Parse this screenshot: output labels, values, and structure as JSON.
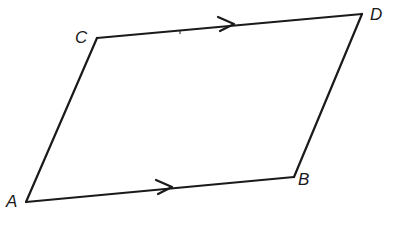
{
  "diagram": {
    "type": "parallelogram",
    "stroke_color": "#1a1a1a",
    "background": "#ffffff",
    "vertices": {
      "A": {
        "label": "A",
        "x": 26,
        "y": 202
      },
      "B": {
        "label": "B",
        "x": 294,
        "y": 177
      },
      "C": {
        "label": "C",
        "x": 97,
        "y": 38
      },
      "D": {
        "label": "D",
        "x": 362,
        "y": 14
      }
    },
    "edges": [
      {
        "from": "A",
        "to": "B",
        "arrow": true
      },
      {
        "from": "C",
        "to": "D",
        "arrow": true
      },
      {
        "from": "A",
        "to": "C",
        "arrow": false
      },
      {
        "from": "B",
        "to": "D",
        "arrow": false
      }
    ],
    "caption": "—  —"
  }
}
